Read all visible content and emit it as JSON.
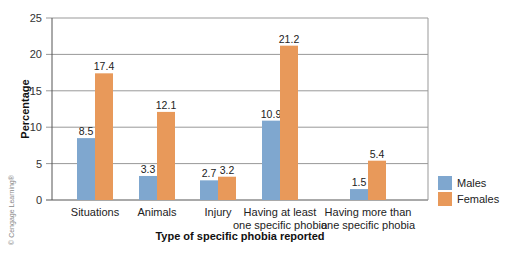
{
  "chart_data": {
    "type": "bar",
    "title": "",
    "xlabel": "Type of specific phobia reported",
    "ylabel": "Percentage",
    "ylim": [
      0,
      25
    ],
    "yticks": [
      0,
      5,
      10,
      15,
      20,
      25
    ],
    "grid": true,
    "legend_position": "right",
    "categories": [
      "Situations",
      "Animals",
      "Injury",
      "Having at least one specific phobia",
      "Having more than one specific phobia"
    ],
    "category_lines": [
      [
        "Situations"
      ],
      [
        "Animals"
      ],
      [
        "Injury"
      ],
      [
        "Having at least",
        "one specific phobia"
      ],
      [
        "Having more than",
        "one specific phobia"
      ]
    ],
    "series": [
      {
        "name": "Males",
        "color": "#7fa7cf",
        "values": [
          8.5,
          3.3,
          2.7,
          10.9,
          1.5
        ]
      },
      {
        "name": "Females",
        "color": "#e8995a",
        "values": [
          17.4,
          12.1,
          3.2,
          21.2,
          5.4
        ]
      }
    ]
  },
  "credit": "© Cengage Learning®"
}
